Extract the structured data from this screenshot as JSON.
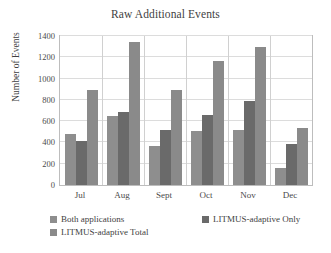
{
  "chart_data": {
    "type": "bar",
    "title": "Raw Additional Events",
    "xlabel": "",
    "ylabel": "Number of Events",
    "categories": [
      "Jul",
      "Aug",
      "Sept",
      "Oct",
      "Nov",
      "Dec"
    ],
    "series": [
      {
        "name": "Both applications",
        "color": "#8e8e8e",
        "values": [
          480,
          650,
          370,
          510,
          515,
          160
        ]
      },
      {
        "name": "LITMUS-adaptive Only",
        "color": "#6a6a6a",
        "values": [
          410,
          690,
          520,
          655,
          785,
          385
        ]
      },
      {
        "name": "LITMUS-adaptive Total",
        "color": "#8a8a8a",
        "values": [
          890,
          1340,
          890,
          1165,
          1295,
          535
        ]
      }
    ],
    "ylim": [
      0,
      1400
    ],
    "ytick_step": 200,
    "yticks": [
      0,
      200,
      400,
      600,
      800,
      1000,
      1200,
      1400
    ],
    "ytick_labels": [
      "0",
      "200",
      "400",
      "600",
      "800",
      "1000",
      "1200",
      "1400"
    ],
    "grid": true,
    "legend_position": "bottom"
  }
}
